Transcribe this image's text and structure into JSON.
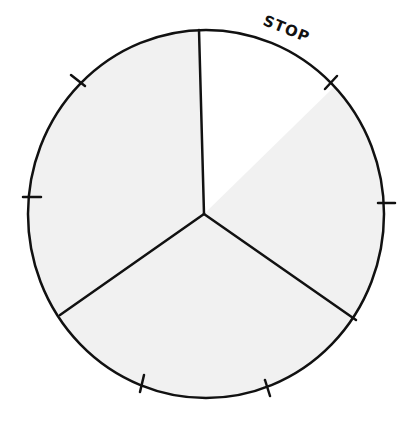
{
  "spinner": {
    "label": "STOP",
    "colors": {
      "fill": "#f1f1f1",
      "highlight": "#ffffff",
      "stroke": "#111111",
      "background": "#ffffff"
    },
    "sections": 3,
    "tick_marks": 6
  }
}
